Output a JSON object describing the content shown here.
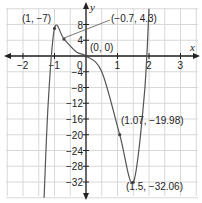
{
  "chart_data": {
    "type": "line",
    "title": "",
    "xlabel": "x",
    "ylabel": "y",
    "xlim": [
      -2.5,
      3.5
    ],
    "ylim": [
      -36,
      12
    ],
    "x_ticks": [
      -2,
      -1,
      1,
      2,
      3
    ],
    "y_ticks": [
      8,
      4,
      0,
      -4,
      -8,
      -12,
      -16,
      -20,
      -24,
      -28,
      -32
    ],
    "grid": true,
    "series": [
      {
        "name": "f(x)",
        "color": "#555555",
        "points": [
          {
            "x": -1.33,
            "y": -36
          },
          {
            "x": -1.2,
            "y": -12
          },
          {
            "x": -1.0,
            "y": 7
          },
          {
            "x": -0.7,
            "y": 4.3
          },
          {
            "x": -0.3,
            "y": 1
          },
          {
            "x": 0,
            "y": 0
          },
          {
            "x": 0.5,
            "y": -4
          },
          {
            "x": 1.07,
            "y": -19.98
          },
          {
            "x": 1.5,
            "y": -32.06
          },
          {
            "x": 1.85,
            "y": -10
          },
          {
            "x": 2.0,
            "y": 12
          }
        ]
      }
    ],
    "annotations": [
      {
        "label": "(1, −7)",
        "x": -1.0,
        "y": 7
      },
      {
        "label": "(−0.7, 4.3)",
        "x": -0.7,
        "y": 4.3
      },
      {
        "label": "(0, 0)",
        "x": 0,
        "y": 0
      },
      {
        "label": "(1.07, −19.98)",
        "x": 1.07,
        "y": -19.98
      },
      {
        "label": "(1.5, −32.06)",
        "x": 1.5,
        "y": -32.06
      }
    ],
    "legend": null
  },
  "labels": {
    "x_axis": "x",
    "y_axis": "y",
    "origin": "0",
    "ann_max": "(1, −7)",
    "ann_infl": "(−0.7, 4.3)",
    "ann_origin": "(0, 0)",
    "ann_mid": "(1.07, −19.98)",
    "ann_min": "(1.5, −32.06)"
  },
  "colors": {
    "grid": "#d8d8d8",
    "axis": "#222222",
    "curve": "#555555"
  }
}
